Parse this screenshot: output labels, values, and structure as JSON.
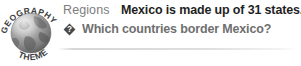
{
  "badge": {
    "top_text": "GEOGRAPHY",
    "bottom_text": "THEME",
    "globe_icon": "globe-icon",
    "colors": {
      "globe_light": "#c9c9c9",
      "globe_mid": "#9a9a9a",
      "globe_dark": "#6b6b6b",
      "ring_text": "#3a3a3a"
    }
  },
  "content": {
    "kicker": "Regions",
    "headline": "Mexico is made up of 31 states.",
    "question_icon": "question-diamond-icon",
    "question": "Which countries border Mexico?"
  },
  "colors": {
    "background": "#ffffff",
    "kicker_text": "#7d7d7d",
    "headline_text": "#1f1f1f",
    "question_text": "#6f6f6f",
    "divider": "#d6d6d6",
    "icon_fill": "#4a4a4a"
  }
}
